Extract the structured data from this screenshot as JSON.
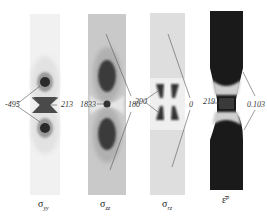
{
  "figure": {
    "panels": [
      {
        "id": "syy",
        "caption_symbol": "σ",
        "caption_sub": "yy",
        "value_labels": [
          "-495",
          "213"
        ]
      },
      {
        "id": "szz",
        "caption_symbol": "σ",
        "caption_sub": "zz",
        "value_labels": [
          "1833",
          "180"
        ]
      },
      {
        "id": "srz",
        "caption_symbol": "σ",
        "caption_sub": "rz",
        "value_labels": [
          "390",
          "0"
        ]
      },
      {
        "id": "ep",
        "caption_symbol": "ε̄",
        "caption_sub": "p",
        "value_labels": [
          "219",
          "0.103"
        ]
      }
    ]
  }
}
